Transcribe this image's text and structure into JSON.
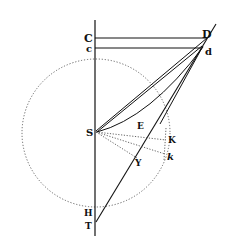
{
  "diagram": {
    "type": "geometric-figure",
    "labels": {
      "C": "C",
      "c": "c",
      "D": "D",
      "d": "d",
      "S": "S",
      "E": "E",
      "K": "K",
      "k": "k",
      "Y": "Y",
      "H": "H",
      "T": "T"
    },
    "colors": {
      "ink": "#111111",
      "dotted": "#555555",
      "background": "#ffffff"
    }
  }
}
